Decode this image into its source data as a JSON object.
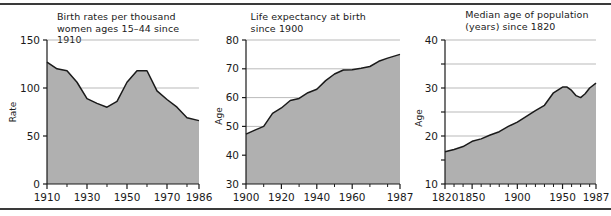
{
  "figure": {
    "name": "three-panel-demographic-figure",
    "top_rule": true,
    "bottom_rule": true,
    "area_fill_color": "#b0b0b0",
    "line_color": "#1a1a1a",
    "grid_color": "#8c8c8c",
    "axis_color": "#1a1a1a"
  },
  "chart_data": [
    {
      "type": "area",
      "title": "Birth rates per thousand\nwomen ages 15–44 since 1910",
      "xlabel": "",
      "ylabel": "Rate",
      "xlim": [
        1910,
        1986
      ],
      "ylim": [
        0,
        150
      ],
      "grid": true,
      "y_ticks": [
        0,
        50,
        100,
        150
      ],
      "y_tick_labels": [
        "0",
        "50",
        "100",
        "150"
      ],
      "x_ticks": [
        1910,
        1930,
        1950,
        1970,
        1986
      ],
      "x_tick_labels": [
        "1910",
        "1930",
        "1950",
        "1970",
        "1986"
      ],
      "x_minor_ticks": [
        1920,
        1940,
        1960,
        1980
      ],
      "x": [
        1910,
        1915,
        1920,
        1925,
        1930,
        1935,
        1940,
        1945,
        1950,
        1955,
        1960,
        1965,
        1970,
        1975,
        1980,
        1986
      ],
      "values": [
        127,
        120,
        118,
        106,
        89,
        84,
        80,
        86,
        106,
        118,
        118,
        97,
        88,
        80,
        69,
        66
      ]
    },
    {
      "type": "area",
      "title": "Life expectancy at birth\nsince 1900",
      "xlabel": "",
      "ylabel": "Age",
      "xlim": [
        1900,
        1987
      ],
      "ylim": [
        30,
        80
      ],
      "grid": true,
      "y_ticks": [
        30,
        40,
        50,
        60,
        70,
        80
      ],
      "y_tick_labels": [
        "30",
        "40",
        "50",
        "60",
        "70",
        "80"
      ],
      "x_ticks": [
        1900,
        1920,
        1940,
        1960,
        1987
      ],
      "x_tick_labels": [
        "1900",
        "1920",
        "1940",
        "1960",
        "1987"
      ],
      "x_minor_ticks": [
        1910,
        1930,
        1950,
        1970,
        1980
      ],
      "x": [
        1900,
        1905,
        1910,
        1915,
        1920,
        1925,
        1930,
        1935,
        1940,
        1945,
        1950,
        1955,
        1960,
        1965,
        1970,
        1975,
        1980,
        1987
      ],
      "values": [
        47.3,
        48.7,
        50.0,
        54.5,
        56.4,
        59.0,
        59.7,
        61.7,
        62.9,
        65.9,
        68.2,
        69.6,
        69.7,
        70.2,
        70.8,
        72.6,
        73.7,
        75.0
      ]
    },
    {
      "type": "area",
      "title": "Median age of population\n(years) since 1820",
      "xlabel": "",
      "ylabel": "Age",
      "xlim": [
        1820,
        1987
      ],
      "ylim": [
        10,
        40
      ],
      "grid": true,
      "y_ticks": [
        10,
        15,
        20,
        25,
        30,
        35,
        40
      ],
      "y_tick_labels": [
        "10",
        "",
        "20",
        "",
        "30",
        "",
        "40"
      ],
      "x_ticks": [
        1820,
        1850,
        1900,
        1950,
        1987
      ],
      "x_tick_labels": [
        "1820",
        "1850",
        "1900",
        "1950",
        "1987"
      ],
      "x_minor_ticks": [
        1830,
        1840,
        1860,
        1870,
        1880,
        1890,
        1910,
        1920,
        1930,
        1940,
        1960,
        1970,
        1980
      ],
      "x": [
        1820,
        1830,
        1840,
        1850,
        1860,
        1870,
        1880,
        1890,
        1900,
        1910,
        1920,
        1930,
        1940,
        1950,
        1955,
        1960,
        1965,
        1970,
        1975,
        1980,
        1987
      ],
      "values": [
        16.7,
        17.2,
        17.8,
        18.9,
        19.4,
        20.2,
        20.9,
        22.0,
        22.9,
        24.1,
        25.3,
        26.4,
        29.0,
        30.2,
        30.2,
        29.5,
        28.4,
        28.0,
        28.8,
        30.0,
        31.0
      ]
    }
  ]
}
